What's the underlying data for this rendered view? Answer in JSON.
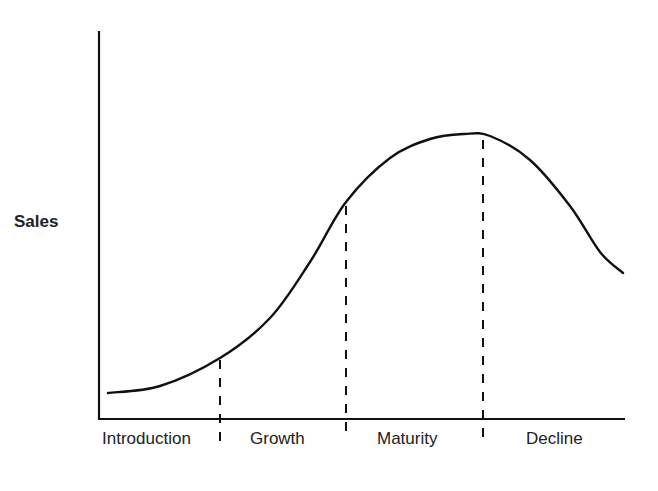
{
  "chart_data": {
    "type": "line",
    "title": "",
    "xlabel": "",
    "ylabel": "Sales",
    "stages": [
      "Introduction",
      "Growth",
      "Maturity",
      "Decline"
    ],
    "stage_boundaries_x": [
      220,
      346,
      483
    ],
    "series": [
      {
        "name": "Sales",
        "description": "Product life cycle curve: slow rise in Introduction, steep rise in Growth, plateau/peak in Maturity, fall in Decline",
        "points": [
          [
            108,
            393
          ],
          [
            160,
            386
          ],
          [
            220,
            358
          ],
          [
            270,
            318
          ],
          [
            310,
            262
          ],
          [
            346,
            202
          ],
          [
            390,
            158
          ],
          [
            430,
            139
          ],
          [
            464,
            134
          ],
          [
            490,
            136
          ],
          [
            530,
            160
          ],
          [
            570,
            206
          ],
          [
            600,
            252
          ],
          [
            623,
            273
          ]
        ]
      }
    ],
    "grid": false,
    "legend": null,
    "colors": {
      "line": "#111111",
      "axis": "#111111",
      "background": "#ffffff"
    }
  },
  "labels": {
    "y_axis": "Sales",
    "introduction": "Introduction",
    "growth": "Growth",
    "maturity": "Maturity",
    "decline": "Decline"
  }
}
